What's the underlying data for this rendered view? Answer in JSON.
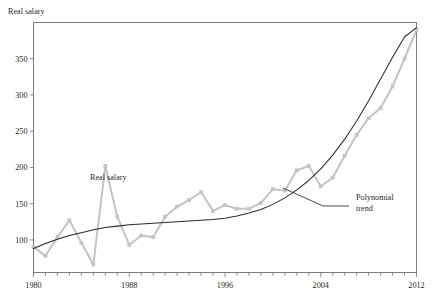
{
  "chart_data": {
    "type": "line",
    "title": "",
    "subtitle": "",
    "xlabel": "",
    "ylabel": "Real salary",
    "xlim": [
      1980,
      2012
    ],
    "ylim": [
      55,
      400
    ],
    "grid": false,
    "legend_position": "inline-annotations",
    "x_ticks_major": [
      1980,
      1988,
      1996,
      2004,
      2012
    ],
    "x_ticks_major_labels": [
      "1980",
      "1988",
      "1996",
      "2004",
      "2012"
    ],
    "x_tick_minor_step": 1,
    "y_ticks": [
      100,
      150,
      200,
      250,
      300,
      350
    ],
    "y_tick_labels": [
      "100",
      "150",
      "200",
      "250",
      "300",
      "350"
    ],
    "x": [
      1980,
      1981,
      1982,
      1983,
      1984,
      1985,
      1986,
      1987,
      1988,
      1989,
      1990,
      1991,
      1992,
      1993,
      1994,
      1995,
      1996,
      1997,
      1998,
      1999,
      2000,
      2001,
      2002,
      2003,
      2004,
      2005,
      2006,
      2007,
      2008,
      2009,
      2010,
      2011,
      2012
    ],
    "series": [
      {
        "name": "Real salary",
        "color": "#c4c4c4",
        "marker": "square",
        "values": [
          90,
          78,
          104,
          127,
          96,
          66,
          202,
          132,
          93,
          106,
          104,
          132,
          146,
          155,
          166,
          140,
          148,
          143,
          143,
          151,
          170,
          168,
          196,
          202,
          174,
          186,
          216,
          245,
          268,
          282,
          312,
          350,
          390
        ]
      },
      {
        "name": "Polynomial trend",
        "color": "#2b2b2b",
        "marker": "none",
        "values": [
          88,
          95,
          101,
          106,
          110,
          114,
          117,
          119,
          121,
          122,
          123,
          124,
          125,
          126,
          127,
          128,
          130,
          133,
          137,
          142,
          149,
          158,
          169,
          182,
          198,
          217,
          239,
          264,
          292,
          322,
          352,
          380,
          393
        ]
      }
    ],
    "annotations": [
      {
        "text": "Real salary",
        "x_px": 90,
        "y_px": 180
      },
      {
        "text": "Polynomial",
        "x_px": 356,
        "y_px": 200
      },
      {
        "text": "trend",
        "x_px": 356,
        "y_px": 211
      }
    ]
  }
}
